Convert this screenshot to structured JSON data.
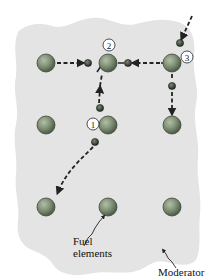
{
  "diagram": {
    "colors": {
      "moderator": "#e3e3e3",
      "fuel": "#7c8c72",
      "neutron": "#2f3a30",
      "path": "#222222",
      "background": "#ffffff"
    },
    "fuel_grid": {
      "rows": 3,
      "columns": 3
    },
    "events": [
      {
        "id": "1",
        "label": "1",
        "description": "fission event 1"
      },
      {
        "id": "2",
        "label": "2",
        "description": "fission event 2"
      },
      {
        "id": "3",
        "label": "3",
        "description": "fission event 3"
      }
    ],
    "labels": {
      "fuel_line1": "Fuel",
      "fuel_line2": "elements",
      "moderator": "Moderator"
    }
  }
}
